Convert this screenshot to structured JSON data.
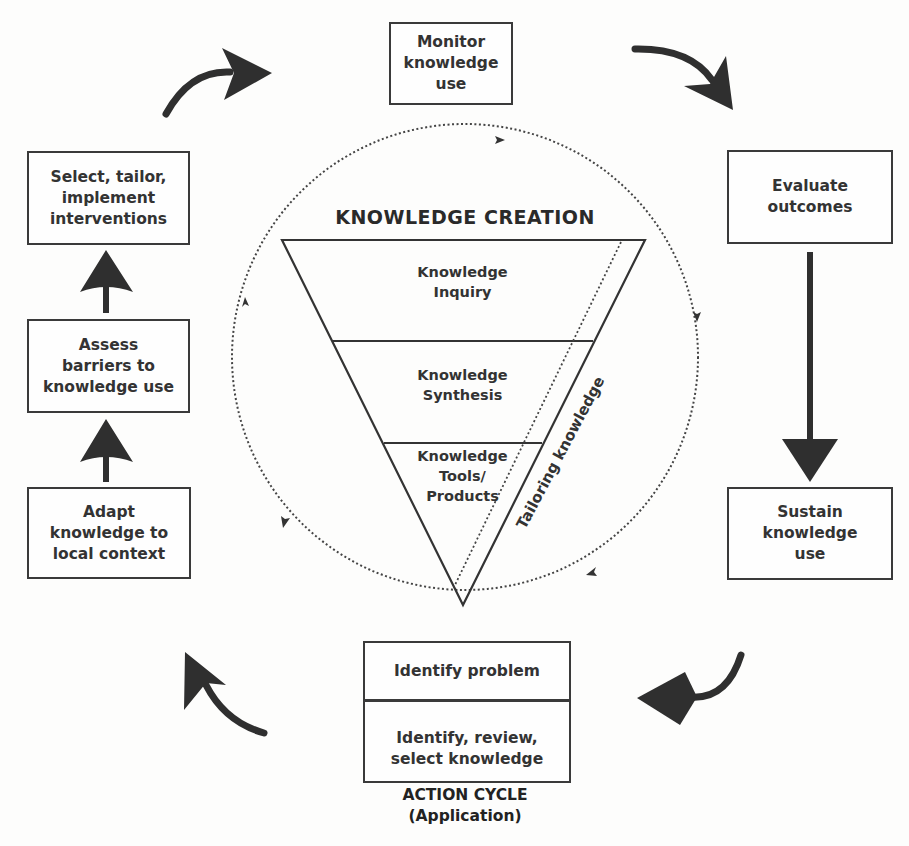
{
  "diagram": {
    "knowledge_creation": {
      "title": "KNOWLEDGE CREATION",
      "tiers": [
        {
          "label": "Knowledge\nInquiry"
        },
        {
          "label": "Knowledge\nSynthesis"
        },
        {
          "label": "Knowledge\nTools/\nProducts"
        }
      ],
      "side_label": "Tailoring knowledge"
    },
    "action_cycle": {
      "title": "ACTION CYCLE\n(Application)",
      "center_box": {
        "top": "Identify problem",
        "bottom": "Identify, review,\nselect knowledge"
      },
      "steps": [
        {
          "id": "monitor",
          "label": "Monitor\nknowledge\nuse"
        },
        {
          "id": "evaluate",
          "label": "Evaluate\noutcomes"
        },
        {
          "id": "sustain",
          "label": "Sustain\nknowledge\nuse"
        },
        {
          "id": "adapt",
          "label": "Adapt\nknowledge to\nlocal context"
        },
        {
          "id": "assess",
          "label": "Assess\nbarriers to\nknowledge use"
        },
        {
          "id": "select",
          "label": "Select, tailor,\nimplement\ninterventions"
        }
      ]
    },
    "colors": {
      "ink": "#2f2f2f",
      "box_border": "#3a3a3a",
      "background": "#fdfdfc"
    }
  }
}
